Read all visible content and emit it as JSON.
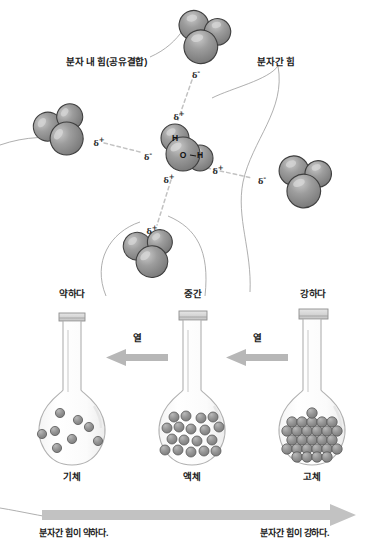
{
  "figure": {
    "title_text": "",
    "annotations": {
      "intramolecular": "분자 내 힘(공유결합)",
      "intermolecular": "분자간 힘"
    },
    "molecule_center": {
      "atoms": [
        {
          "symbol": "H",
          "position": "top-left"
        },
        {
          "symbol": "O",
          "position": "center"
        },
        {
          "symbol": "H",
          "position": "right"
        }
      ],
      "partial_charges": [
        {
          "label": "δ",
          "sign": "+",
          "position": "top"
        },
        {
          "label": "δ",
          "sign": "-",
          "position": "left"
        },
        {
          "label": "δ",
          "sign": "-",
          "position": "right"
        },
        {
          "label": "δ",
          "sign": "+",
          "position": "bottom"
        }
      ]
    },
    "neighbor_charges": [
      {
        "label": "δ",
        "sign": "-",
        "position": "top-molecule-bottom"
      },
      {
        "label": "δ",
        "sign": "+",
        "position": "left-molecule-right"
      },
      {
        "label": "δ",
        "sign": "-",
        "position": "right-molecule-left"
      },
      {
        "label": "δ",
        "sign": "+",
        "position": "bottom-molecule-top"
      }
    ]
  },
  "strength_labels": [
    "약하다",
    "중간",
    "강하다"
  ],
  "heat_labels": [
    "열",
    "열"
  ],
  "state_labels": [
    "기체",
    "액체",
    "고체"
  ],
  "bottom_captions": {
    "left": "분자간 힘이 약하다.",
    "right": "분자간 힘이 강하다."
  },
  "colors": {
    "sphere_fill": "#8c8c8c",
    "sphere_stroke": "#3d3d3d",
    "sphere_highlight": "#cfcfcf",
    "glass_stroke": "#aeaeae",
    "arrow_fill": "#b4b4b4",
    "text": "#1a1a1a",
    "dashed_bond": "#bdbdbd",
    "thin_line": "#9a9a9a",
    "background": "#ffffff"
  },
  "particle_counts": {
    "gas": 8,
    "liquid": 18,
    "solid": 27
  }
}
